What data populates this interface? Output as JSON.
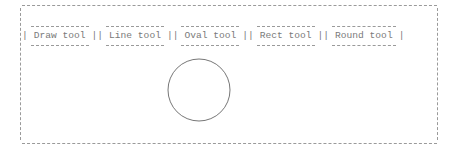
{
  "toolbar": {
    "tools": [
      {
        "label": "Draw tool"
      },
      {
        "label": "Line tool"
      },
      {
        "label": "Oval tool"
      },
      {
        "label": "Rect tool"
      },
      {
        "label": "Round tool"
      }
    ],
    "separator": "|"
  },
  "canvas": {
    "shapes": [
      {
        "type": "circle",
        "cx": 199,
        "cy": 90,
        "r": 31,
        "stroke": "#777777"
      }
    ]
  },
  "colors": {
    "text": "#7a7a7a",
    "border": "#9a9a9a",
    "background": "#ffffff"
  }
}
